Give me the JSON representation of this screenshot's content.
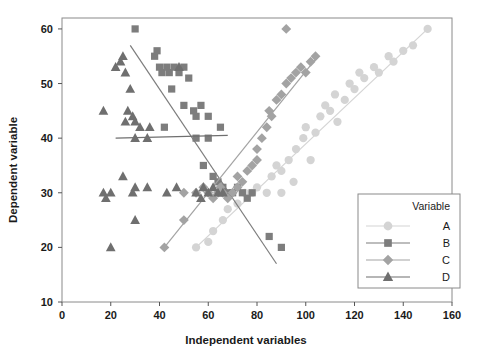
{
  "chart_data": {
    "type": "scatter",
    "title": "",
    "xlabel": "Independent variables",
    "ylabel": "Dependent variable",
    "xlim": [
      0,
      160
    ],
    "ylim": [
      10,
      62
    ],
    "xticks": [
      0,
      20,
      40,
      60,
      80,
      100,
      120,
      140,
      160
    ],
    "yticks": [
      10,
      20,
      30,
      40,
      50,
      60
    ],
    "grid": false,
    "legend": {
      "title": "Variable",
      "position": "bottom-right",
      "entries": [
        {
          "label": "A",
          "marker": "circle",
          "color": "#d4d4d4"
        },
        {
          "label": "B",
          "marker": "square",
          "color": "#7d7d7d"
        },
        {
          "label": "C",
          "marker": "diamond",
          "color": "#a3a3a3"
        },
        {
          "label": "D",
          "marker": "triangle",
          "color": "#6f6f6f"
        }
      ]
    },
    "series": [
      {
        "name": "A",
        "marker": "circle",
        "color": "#d4d4d4",
        "trendline": {
          "x": [
            55,
            150
          ],
          "y": [
            20,
            60
          ]
        },
        "points": [
          [
            55,
            20
          ],
          [
            60,
            21
          ],
          [
            62,
            23
          ],
          [
            66,
            25
          ],
          [
            68,
            27
          ],
          [
            72,
            28
          ],
          [
            75,
            30
          ],
          [
            78,
            30
          ],
          [
            80,
            31
          ],
          [
            84,
            30
          ],
          [
            86,
            33
          ],
          [
            88,
            35
          ],
          [
            90,
            34
          ],
          [
            93,
            36
          ],
          [
            96,
            38
          ],
          [
            99,
            40
          ],
          [
            100,
            42
          ],
          [
            104,
            41
          ],
          [
            106,
            44
          ],
          [
            108,
            46
          ],
          [
            110,
            45
          ],
          [
            112,
            48
          ],
          [
            116,
            47
          ],
          [
            118,
            50
          ],
          [
            120,
            49
          ],
          [
            122,
            52
          ],
          [
            124,
            51
          ],
          [
            128,
            53
          ],
          [
            130,
            52
          ],
          [
            134,
            55
          ],
          [
            136,
            54
          ],
          [
            140,
            56
          ],
          [
            144,
            57
          ],
          [
            150,
            60
          ],
          [
            90,
            30
          ],
          [
            95,
            32
          ],
          [
            102,
            36
          ],
          [
            113,
            43
          ]
        ]
      },
      {
        "name": "B",
        "marker": "square",
        "color": "#7d7d7d",
        "trendline": {
          "x": [
            28,
            88
          ],
          "y": [
            57,
            17
          ]
        },
        "points": [
          [
            30,
            60
          ],
          [
            38,
            55
          ],
          [
            39,
            56
          ],
          [
            40,
            53
          ],
          [
            41,
            52
          ],
          [
            43,
            53
          ],
          [
            44,
            52
          ],
          [
            46,
            53
          ],
          [
            48,
            52
          ],
          [
            50,
            53
          ],
          [
            45,
            49
          ],
          [
            50,
            46
          ],
          [
            54,
            45
          ],
          [
            55,
            44
          ],
          [
            57,
            46
          ],
          [
            60,
            44
          ],
          [
            65,
            42
          ],
          [
            60,
            40
          ],
          [
            55,
            40
          ],
          [
            62,
            33
          ],
          [
            64,
            32
          ],
          [
            66,
            31
          ],
          [
            68,
            30
          ],
          [
            70,
            30
          ],
          [
            72,
            31
          ],
          [
            74,
            30
          ],
          [
            76,
            29
          ],
          [
            78,
            30
          ],
          [
            85,
            22
          ],
          [
            90,
            20
          ],
          [
            42,
            42
          ],
          [
            52,
            51
          ],
          [
            58,
            35
          ]
        ]
      },
      {
        "name": "C",
        "marker": "diamond",
        "color": "#a3a3a3",
        "trendline": {
          "x": [
            42,
            105
          ],
          "y": [
            20,
            55
          ]
        },
        "points": [
          [
            42,
            20
          ],
          [
            50,
            25
          ],
          [
            50,
            30
          ],
          [
            55,
            30
          ],
          [
            58,
            31
          ],
          [
            60,
            30
          ],
          [
            62,
            29
          ],
          [
            64,
            30
          ],
          [
            65,
            31
          ],
          [
            66,
            30
          ],
          [
            68,
            29
          ],
          [
            70,
            30
          ],
          [
            72,
            31
          ],
          [
            74,
            32
          ],
          [
            76,
            34
          ],
          [
            78,
            35
          ],
          [
            80,
            38
          ],
          [
            82,
            40
          ],
          [
            84,
            42
          ],
          [
            85,
            45
          ],
          [
            86,
            44
          ],
          [
            88,
            47
          ],
          [
            90,
            48
          ],
          [
            92,
            50
          ],
          [
            94,
            51
          ],
          [
            96,
            52
          ],
          [
            98,
            53
          ],
          [
            100,
            52
          ],
          [
            102,
            54
          ],
          [
            104,
            55
          ],
          [
            92,
            60
          ],
          [
            80,
            36
          ],
          [
            72,
            33
          ]
        ]
      },
      {
        "name": "D",
        "marker": "triangle",
        "color": "#6f6f6f",
        "trendline": {
          "x": [
            22,
            68
          ],
          "y": [
            40,
            40.5
          ]
        },
        "points": [
          [
            17,
            45
          ],
          [
            17,
            30
          ],
          [
            18,
            29
          ],
          [
            20,
            30
          ],
          [
            20,
            20
          ],
          [
            22,
            53
          ],
          [
            24,
            54
          ],
          [
            25,
            55
          ],
          [
            25,
            33
          ],
          [
            26,
            52
          ],
          [
            27,
            45
          ],
          [
            28,
            49
          ],
          [
            29,
            44
          ],
          [
            30,
            31
          ],
          [
            30,
            25
          ],
          [
            30,
            43
          ],
          [
            30,
            40
          ],
          [
            32,
            42
          ],
          [
            35,
            31
          ],
          [
            36,
            42
          ],
          [
            43,
            30
          ],
          [
            47,
            31
          ],
          [
            48,
            53
          ],
          [
            55,
            30
          ],
          [
            58,
            31
          ],
          [
            60,
            30
          ],
          [
            62,
            31
          ],
          [
            64,
            30
          ],
          [
            66,
            30
          ],
          [
            57,
            29
          ],
          [
            26,
            43
          ],
          [
            29,
            30
          ],
          [
            35,
            40
          ]
        ]
      }
    ]
  },
  "axes": {
    "x_title": "Independent variables",
    "y_title": "Dependent variable",
    "x_ticks": [
      "0",
      "20",
      "40",
      "60",
      "80",
      "100",
      "120",
      "140",
      "160"
    ],
    "y_ticks": [
      "10",
      "20",
      "30",
      "40",
      "50",
      "60"
    ]
  },
  "legend": {
    "title": "Variable",
    "items": [
      "A",
      "B",
      "C",
      "D"
    ]
  }
}
